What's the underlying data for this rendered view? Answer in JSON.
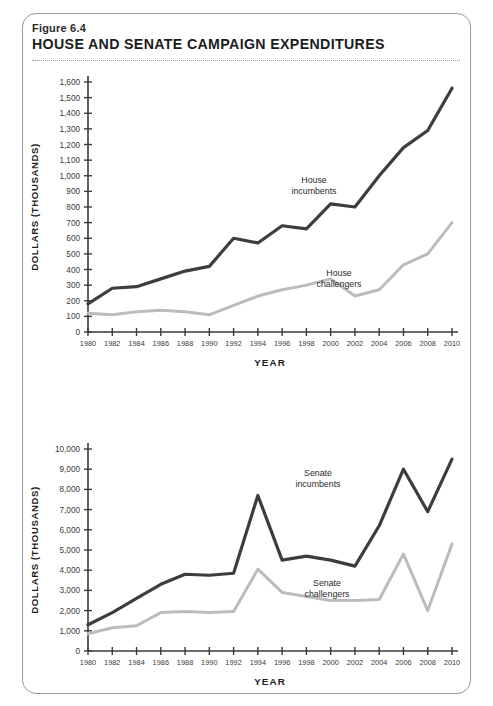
{
  "figure": {
    "number": "Figure 6.4",
    "title": "HOUSE AND SENATE CAMPAIGN EXPENDITURES"
  },
  "colors": {
    "incumbent_line": "#3d3d3d",
    "challenger_line": "#bcbcbc",
    "axis": "#3a3a3a",
    "panel_border": "#9a9a9a",
    "text": "#1c1c1c"
  },
  "chart_data": [
    {
      "type": "line",
      "id": "house",
      "title": "House campaign expenditures",
      "xlabel": "YEAR",
      "ylabel": "DOLLARS (THOUSANDS)",
      "x": [
        1980,
        1982,
        1984,
        1986,
        1988,
        1990,
        1992,
        1994,
        1996,
        1998,
        2000,
        2002,
        2004,
        2006,
        2008,
        2010
      ],
      "xtick_labels": [
        "1980",
        "1982",
        "1984",
        "1986",
        "1988",
        "1990",
        "1992",
        "1994",
        "1996",
        "1998",
        "2000",
        "2002",
        "2004",
        "2006",
        "2008",
        "2010"
      ],
      "ytick_labels": [
        "0",
        "100",
        "200",
        "300",
        "400",
        "500",
        "600",
        "700",
        "800",
        "900",
        "1,000",
        "1,100",
        "1,200",
        "1,300",
        "1,400",
        "1,500",
        "1,600"
      ],
      "ytick_values": [
        0,
        100,
        200,
        300,
        400,
        500,
        600,
        700,
        800,
        900,
        1000,
        1100,
        1200,
        1300,
        1400,
        1500,
        1600
      ],
      "ylim": [
        0,
        1600
      ],
      "xlim": [
        1980,
        2010
      ],
      "grid": false,
      "legend_position": "inline-annotations",
      "series": [
        {
          "name": "House incumbents",
          "color": "#3d3d3d",
          "annotation": "House\nincumbents",
          "annotation_line1": "House",
          "annotation_line2": "incumbents",
          "values": [
            180,
            280,
            290,
            340,
            390,
            420,
            600,
            570,
            680,
            660,
            820,
            800,
            1000,
            1180,
            1290,
            1560
          ]
        },
        {
          "name": "House challengers",
          "color": "#bcbcbc",
          "annotation_line1": "House",
          "annotation_line2": "challengers",
          "values": [
            120,
            110,
            130,
            140,
            130,
            110,
            170,
            230,
            270,
            300,
            340,
            230,
            270,
            430,
            500,
            700
          ]
        }
      ]
    },
    {
      "type": "line",
      "id": "senate",
      "title": "Senate campaign expenditures",
      "xlabel": "YEAR",
      "ylabel": "DOLLARS (THOUSANDS)",
      "x": [
        1980,
        1982,
        1984,
        1986,
        1988,
        1990,
        1992,
        1994,
        1996,
        1998,
        2000,
        2002,
        2004,
        2006,
        2008,
        2010
      ],
      "xtick_labels": [
        "1980",
        "1982",
        "1984",
        "1986",
        "1988",
        "1990",
        "1992",
        "1994",
        "1996",
        "1998",
        "2000",
        "2002",
        "2004",
        "2006",
        "2008",
        "2010"
      ],
      "ytick_labels": [
        "0",
        "1,000",
        "2,000",
        "3,000",
        "4,000",
        "5,000",
        "6,000",
        "7,000",
        "8,000",
        "9,000",
        "10,000"
      ],
      "ytick_values": [
        0,
        1000,
        2000,
        3000,
        4000,
        5000,
        6000,
        7000,
        8000,
        9000,
        10000
      ],
      "ylim": [
        0,
        10000
      ],
      "xlim": [
        1980,
        2010
      ],
      "grid": false,
      "legend_position": "inline-annotations",
      "series": [
        {
          "name": "Senate incumbents",
          "color": "#3d3d3d",
          "annotation_line1": "Senate",
          "annotation_line2": "incumbents",
          "values": [
            1300,
            1900,
            2600,
            3300,
            3800,
            3750,
            3850,
            7700,
            4500,
            4700,
            4500,
            4200,
            6200,
            9000,
            6900,
            9500
          ]
        },
        {
          "name": "Senate challengers",
          "color": "#bcbcbc",
          "annotation_line1": "Senate",
          "annotation_line2": "challengers",
          "values": [
            850,
            1150,
            1250,
            1900,
            1950,
            1900,
            1950,
            4050,
            2900,
            2700,
            2500,
            2500,
            2550,
            4800,
            2000,
            5300
          ]
        }
      ]
    }
  ]
}
